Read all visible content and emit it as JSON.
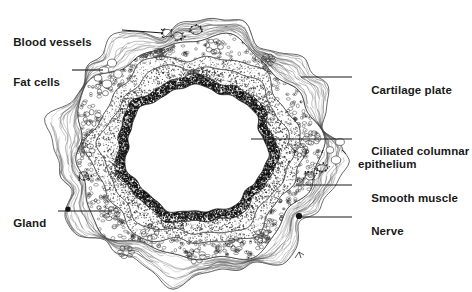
{
  "figure": {
    "background_color": "#ffffff",
    "ink_color": "#1a1a1a",
    "width": 472,
    "height": 292
  },
  "labels": [
    {
      "id": "blood-vessels",
      "text": "Blood vessels",
      "side": "left",
      "x": 30,
      "y": 22,
      "leader": {
        "x1": 122,
        "y1": 30,
        "x2": 163,
        "y2": 33
      }
    },
    {
      "id": "fat-cells",
      "text": "Fat cells",
      "side": "left",
      "x": 18,
      "y": 62,
      "leader": {
        "x1": 72,
        "y1": 70,
        "x2": 103,
        "y2": 70
      }
    },
    {
      "id": "gland",
      "text": "Gland",
      "side": "left",
      "x": 12,
      "y": 203,
      "leader": {
        "x1": 58,
        "y1": 211,
        "x2": 112,
        "y2": 211
      }
    },
    {
      "id": "cartilage-plate",
      "text": "Cartilage plate",
      "side": "right",
      "x": 358,
      "y": 70,
      "leader": {
        "x1": 301,
        "y1": 77,
        "x2": 352,
        "y2": 77
      }
    },
    {
      "id": "ciliated-columnar-epithelium",
      "text": "Ciliated columnar\nepithelium",
      "side": "right",
      "x": 358,
      "y": 131,
      "leader": {
        "x1": 251,
        "y1": 139,
        "x2": 352,
        "y2": 139
      }
    },
    {
      "id": "smooth-muscle",
      "text": "Smooth muscle",
      "side": "right",
      "x": 358,
      "y": 178,
      "leader": {
        "x1": 296,
        "y1": 185,
        "x2": 352,
        "y2": 185
      }
    },
    {
      "id": "nerve",
      "text": "Nerve",
      "side": "right",
      "x": 358,
      "y": 211,
      "leader": {
        "x1": 300,
        "y1": 217,
        "x2": 352,
        "y2": 217
      }
    }
  ],
  "markers": [
    {
      "id": "nerve-dot",
      "cx": 299,
      "cy": 216,
      "r": 3.1
    },
    {
      "id": "gland-dot",
      "cx": 68,
      "cy": 209,
      "r": 2.6
    }
  ],
  "structure": {
    "center": {
      "cx": 196,
      "cy": 150
    },
    "lumen_radius": {
      "rx": 70,
      "ry": 63
    },
    "epithelium_radius": {
      "rx": 80,
      "ry": 73
    },
    "lamina_propria_radius": {
      "rx": 93,
      "ry": 85
    },
    "smooth_muscle_radius": {
      "rx": 104,
      "ry": 95
    },
    "cartilage_radius": {
      "rx": 122,
      "ry": 110
    },
    "adventitia_radius": {
      "rx": 142,
      "ry": 128
    }
  }
}
